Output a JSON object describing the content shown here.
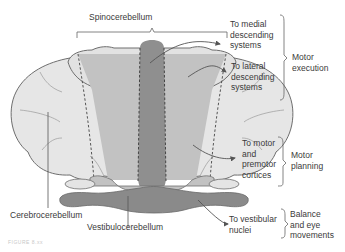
{
  "figure": {
    "title_label": "Spinocerebellum",
    "left_label": "Cerebrocerebellum",
    "bottom_label": "Vestibulocerebellum",
    "targets": [
      {
        "lines": [
          "To medial",
          "descending",
          "systems"
        ]
      },
      {
        "lines": [
          "To lateral",
          "descending",
          "systems"
        ]
      },
      {
        "lines": [
          "To motor",
          "and",
          "premotor",
          "cortices"
        ]
      },
      {
        "lines": [
          "To vestibular",
          "nuclei"
        ]
      }
    ],
    "functions": [
      {
        "lines": [
          "Motor",
          "execution"
        ]
      },
      {
        "lines": [
          "Motor",
          "planning"
        ]
      },
      {
        "lines": [
          "Balance",
          "and eye",
          "movements"
        ]
      }
    ],
    "caption": "FIGURE 8.xx"
  },
  "colors": {
    "hemisphere": "#e6e6e6",
    "paravermis": "#c2c2c2",
    "vermis": "#8f8f8f",
    "flocculonodular": "#8a8a8a",
    "outline": "#6e6e6e"
  }
}
